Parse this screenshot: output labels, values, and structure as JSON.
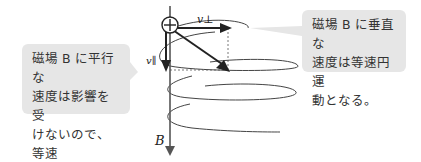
{
  "diagram": {
    "title": "",
    "callouts": {
      "left": {
        "lines": [
          "磁場 B に平行な",
          "速度は影響を受",
          "けないので、等速",
          "直線運動となる。"
        ]
      },
      "right": {
        "lines": [
          "磁場 B に垂直な",
          "速度は等速円運",
          "動となる。"
        ]
      }
    },
    "labels": {
      "v_perp": "v⊥",
      "v_parallel": "v∥",
      "B": "B",
      "charge": "+"
    },
    "colors": {
      "callout_bg": "#e6e6e6",
      "arrow": "#222222",
      "axis": "#555555"
    }
  }
}
